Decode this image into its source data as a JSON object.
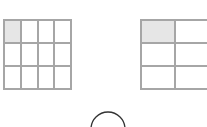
{
  "diagram": {
    "left_grid": {
      "rows": 3,
      "cols": 4,
      "shaded_cells": [
        [
          0,
          0
        ]
      ],
      "shade_color": "#e6e6e6",
      "line_color": "#a6a6a6"
    },
    "right_grid": {
      "rows": 3,
      "cols_visible": 2,
      "shaded_cells": [
        [
          0,
          0
        ]
      ],
      "shade_color": "#e6e6e6",
      "line_color": "#a6a6a6"
    },
    "arc": {
      "shape": "semicircle-top",
      "stroke_color": "#333333"
    }
  }
}
